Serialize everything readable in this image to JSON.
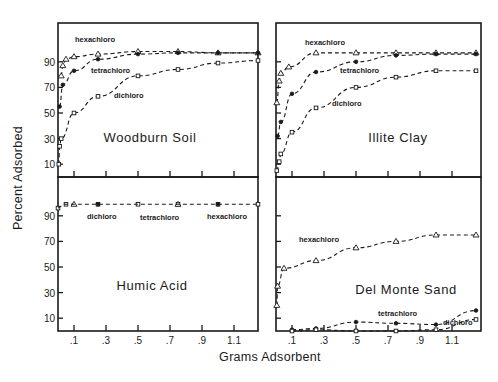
{
  "chart_data": {
    "type": "line",
    "xlabel": "Grams Adsorbent",
    "ylabel": "Percent Adsorbed",
    "x_ticks": [
      ".1",
      ".3",
      ".5",
      ".7",
      ".9",
      "1.1"
    ],
    "x_tick_values": [
      0.1,
      0.3,
      0.5,
      0.7,
      0.9,
      1.1
    ],
    "y_ticks": [
      "10",
      "30",
      "50",
      "70",
      "90"
    ],
    "y_tick_values": [
      10,
      30,
      50,
      70,
      90
    ],
    "xlim": [
      0,
      1.25
    ],
    "ylim": [
      0,
      100
    ],
    "grid": false,
    "panels": [
      {
        "title": "Woodburn Soil",
        "position": "top-left",
        "series": [
          {
            "name": "hexachloro",
            "marker": "triangle",
            "x": [
              0.02,
              0.03,
              0.05,
              0.1,
              0.25,
              0.5,
              0.75,
              1.0,
              1.25
            ],
            "y": [
              79,
              87,
              92,
              94,
              96,
              98,
              98,
              97,
              97
            ]
          },
          {
            "name": "tetrachloro",
            "marker": "circle",
            "x": [
              0.01,
              0.03,
              0.1,
              0.25,
              0.5,
              0.75,
              1.0,
              1.25
            ],
            "y": [
              55,
              72,
              83,
              92,
              96,
              97,
              97,
              97
            ]
          },
          {
            "name": "dichloro",
            "marker": "square",
            "x": [
              0.005,
              0.01,
              0.02,
              0.1,
              0.25,
              0.5,
              0.75,
              1.0,
              1.25
            ],
            "y": [
              10,
              24,
              30,
              50,
              63,
              79,
              84,
              89,
              91
            ]
          }
        ]
      },
      {
        "title": "Illite Clay",
        "position": "top-right",
        "series": [
          {
            "name": "hexachloro",
            "marker": "triangle",
            "x": [
              0.005,
              0.02,
              0.03,
              0.08,
              0.25,
              0.5,
              0.75,
              1.0,
              1.25
            ],
            "y": [
              58,
              75,
              81,
              86,
              97,
              97,
              97,
              97,
              97
            ]
          },
          {
            "name": "tetrachloro",
            "marker": "circle",
            "x": [
              0.01,
              0.03,
              0.1,
              0.25,
              0.5,
              0.75,
              1.0,
              1.25
            ],
            "y": [
              32,
              43,
              65,
              82,
              90,
              95,
              96,
              96
            ]
          },
          {
            "name": "dichloro",
            "marker": "square",
            "x": [
              0.005,
              0.02,
              0.03,
              0.1,
              0.25,
              0.5,
              0.75,
              1.0,
              1.25
            ],
            "y": [
              5,
              12,
              18,
              35,
              54,
              70,
              78,
              83,
              83
            ]
          }
        ]
      },
      {
        "title": "Humic Acid",
        "position": "bottom-left",
        "series": [
          {
            "name": "dichloro",
            "marker": "square",
            "x": [
              0.0,
              0.05,
              0.25,
              0.5,
              0.75,
              1.0,
              1.25
            ],
            "y": [
              96,
              99,
              99,
              99,
              99,
              99,
              99
            ]
          },
          {
            "name": "tetrachloro",
            "marker": "triangle",
            "x": [
              0.1,
              0.75
            ],
            "y": [
              99,
              99
            ]
          },
          {
            "name": "hexachloro",
            "marker": "circle",
            "x": [
              0.25,
              1.0
            ],
            "y": [
              99,
              99
            ]
          }
        ],
        "label_order": [
          "dichloro",
          "tetrachloro",
          "hexachloro"
        ]
      },
      {
        "title": "Del Monte Sand",
        "position": "bottom-right",
        "series": [
          {
            "name": "hexachloro",
            "marker": "triangle",
            "x": [
              0.005,
              0.01,
              0.05,
              0.25,
              0.5,
              0.75,
              1.0,
              1.25
            ],
            "y": [
              20,
              35,
              49,
              55,
              65,
              70,
              75,
              75
            ]
          },
          {
            "name": "tetrachloro",
            "marker": "circle",
            "x": [
              0.1,
              0.25,
              0.5,
              0.75,
              1.0,
              1.25
            ],
            "y": [
              1,
              2,
              7,
              6,
              5,
              16
            ]
          },
          {
            "name": "dichloro",
            "marker": "square",
            "x": [
              0.1,
              0.25,
              0.5,
              0.75,
              1.0,
              1.25
            ],
            "y": [
              0,
              1,
              0,
              0,
              1,
              9
            ]
          }
        ]
      }
    ]
  }
}
